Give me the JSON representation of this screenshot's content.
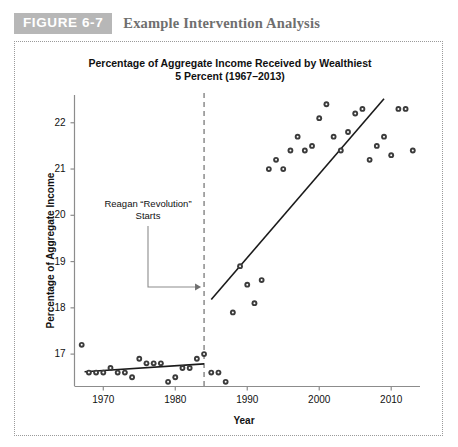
{
  "figure": {
    "tag": "FIGURE 6-7",
    "caption": "Example Intervention Analysis",
    "tag_color": "#b7b7b7",
    "caption_color": "#6f6f6f"
  },
  "chart_data": {
    "type": "scatter",
    "title_line1": "Percentage of Aggregate Income Received by Wealthiest",
    "title_line2": "5 Percent (1967–2013)",
    "xlabel": "Year",
    "ylabel": "Percentage of Aggregate Income",
    "xlim": [
      1966,
      2014
    ],
    "ylim": [
      16.3,
      22.6
    ],
    "xticks": [
      1970,
      1980,
      1990,
      2000,
      2010
    ],
    "yticks": [
      17,
      18,
      19,
      20,
      21,
      22
    ],
    "grid": false,
    "legend": "none",
    "marker_color": "#3b3b3b",
    "line_color": "#1a1a1a",
    "intervention": {
      "year": 1984,
      "style": "dashed",
      "color": "#6e6e6e",
      "label_line1": "Reagan “Revolution”",
      "label_line2": "Starts"
    },
    "series": [
      {
        "name": "Percentage of aggregate income, wealthiest 5 percent",
        "x": [
          1967,
          1968,
          1969,
          1970,
          1971,
          1972,
          1973,
          1974,
          1975,
          1976,
          1977,
          1978,
          1979,
          1980,
          1981,
          1982,
          1983,
          1984,
          1985,
          1986,
          1987,
          1988,
          1989,
          1990,
          1991,
          1992,
          1993,
          1994,
          1995,
          1996,
          1997,
          1998,
          1999,
          2000,
          2001,
          2002,
          2003,
          2004,
          2005,
          2006,
          2007,
          2008,
          2009,
          2010,
          2011,
          2012,
          2013
        ],
        "y": [
          17.2,
          16.6,
          16.6,
          16.6,
          16.7,
          16.6,
          16.6,
          16.5,
          16.9,
          16.8,
          16.8,
          16.8,
          16.4,
          16.5,
          16.7,
          16.7,
          16.9,
          17.0,
          16.6,
          16.6,
          16.4,
          17.9,
          18.9,
          18.5,
          18.1,
          18.6,
          21.0,
          21.2,
          21.0,
          21.4,
          21.7,
          21.4,
          21.5,
          22.1,
          22.4,
          21.7,
          21.4,
          21.8,
          22.2,
          22.3,
          21.2,
          21.5,
          21.7,
          21.3,
          22.3,
          22.3,
          21.4
        ]
      }
    ],
    "trend_lines": [
      {
        "name": "pre-intervention-trend",
        "x": [
          1967.4,
          1984.0
        ],
        "y": [
          16.62,
          16.79
        ]
      },
      {
        "name": "post-intervention-trend",
        "x": [
          1985.0,
          2009.0
        ],
        "y": [
          18.18,
          22.52
        ]
      }
    ]
  }
}
